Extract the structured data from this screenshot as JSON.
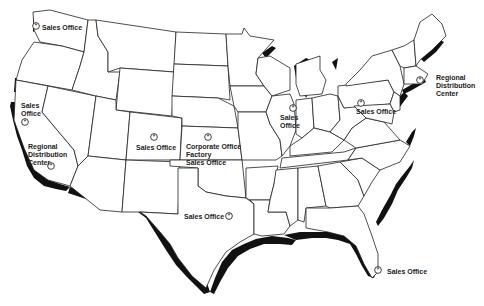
{
  "map": {
    "title": "United States Locations Map",
    "background": "#ffffff",
    "outline_color": "#222222",
    "coast_shadow_color": "#111111",
    "marker_icon": "circled-star-icon"
  },
  "locations": [
    {
      "id": "seattle",
      "label_lines": [
        "Sales Office"
      ],
      "marker": {
        "x": 36,
        "y": 26
      },
      "label": {
        "x": 44,
        "y": 27
      }
    },
    {
      "id": "sf",
      "label_lines": [
        "Sales",
        "Office"
      ],
      "marker": {
        "x": 25,
        "y": 121
      },
      "label": {
        "x": 21,
        "y": 109
      }
    },
    {
      "id": "la",
      "label_lines": [
        "Regional",
        "Distribution",
        "Center"
      ],
      "marker": {
        "x": 48,
        "y": 166
      },
      "label": {
        "x": 27,
        "y": 147
      }
    },
    {
      "id": "denver",
      "label_lines": [
        "Sales Office"
      ],
      "marker": {
        "x": 151,
        "y": 134
      },
      "label": {
        "x": 136,
        "y": 146
      }
    },
    {
      "id": "kansas",
      "label_lines": [
        "Corporate Office",
        "Factory",
        "Sales Office"
      ],
      "marker": {
        "x": 205,
        "y": 133
      },
      "label": {
        "x": 186,
        "y": 144
      }
    },
    {
      "id": "texas",
      "label_lines": [
        "Sales Office"
      ],
      "marker": {
        "x": 224,
        "y": 213
      },
      "label": {
        "x": 184,
        "y": 214
      }
    },
    {
      "id": "chicago",
      "label_lines": [
        "Sales",
        "Office"
      ],
      "marker": {
        "x": 289,
        "y": 104
      },
      "label": {
        "x": 281,
        "y": 114
      }
    },
    {
      "id": "pennsylvania",
      "label_lines": [
        "Sales Office"
      ],
      "marker": {
        "x": 361,
        "y": 98
      },
      "label": {
        "x": 356,
        "y": 107
      }
    },
    {
      "id": "boston",
      "label_lines": [
        "Regional",
        "Distribution",
        "Center"
      ],
      "marker": {
        "x": 419,
        "y": 78
      },
      "label": {
        "x": 436,
        "y": 75
      }
    },
    {
      "id": "florida",
      "label_lines": [
        "Sales Office"
      ],
      "marker": {
        "x": 374,
        "y": 267
      },
      "label": {
        "x": 387,
        "y": 268
      }
    }
  ]
}
